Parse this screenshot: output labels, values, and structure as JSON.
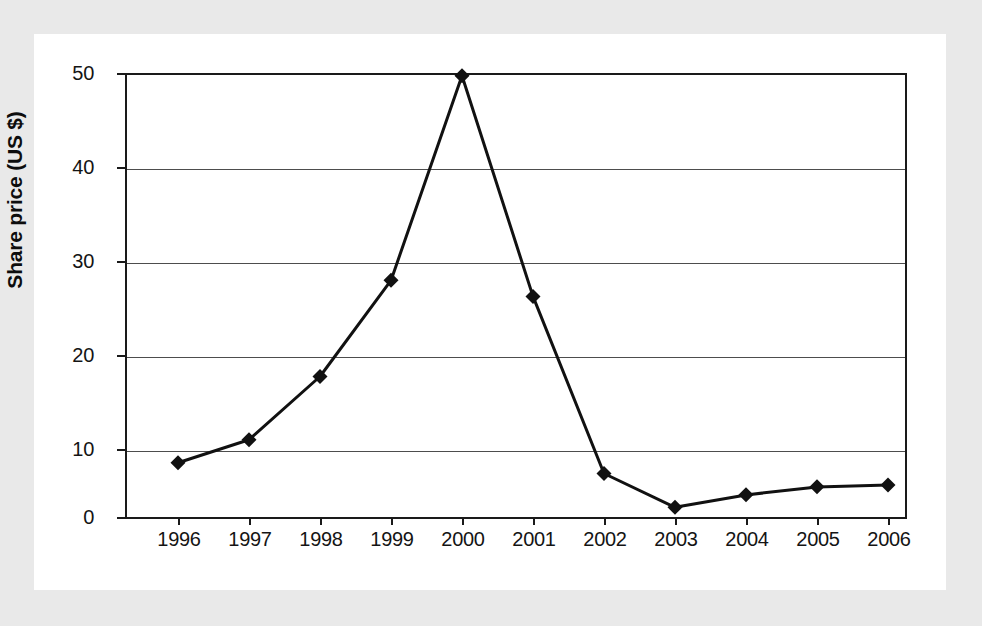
{
  "chart_data": {
    "type": "line",
    "title": "",
    "xlabel": "",
    "ylabel": "Share price (US $)",
    "categories": [
      "1996",
      "1997",
      "1998",
      "1999",
      "2000",
      "2001",
      "2002",
      "2003",
      "2004",
      "2005",
      "2006"
    ],
    "values": [
      6.2,
      8.8,
      15.9,
      26.7,
      49.7,
      24.9,
      5.0,
      1.2,
      2.6,
      3.5,
      3.7
    ],
    "series": [
      {
        "name": "Share price",
        "values": [
          6.2,
          8.8,
          15.9,
          26.7,
          49.7,
          24.9,
          5.0,
          1.2,
          2.6,
          3.5,
          3.7
        ]
      }
    ],
    "ylim": [
      0,
      50
    ],
    "yticks": [
      "0",
      "10",
      "20",
      "30",
      "40",
      "50"
    ],
    "ytick_values": [
      0,
      10,
      20,
      30,
      40,
      50
    ],
    "grid": true,
    "legend": "none",
    "marker": "diamond",
    "line_color": "#111111",
    "marker_color": "#111111",
    "grid_color": "#4d4d4d",
    "background_color": "#ffffff"
  },
  "axes": {
    "y_title": "Share price (US $)",
    "y_labels": [
      "50",
      "40",
      "30",
      "20",
      "10",
      "0"
    ],
    "x_labels": [
      "1996",
      "1997",
      "1998",
      "1999",
      "2000",
      "2001",
      "2002",
      "2003",
      "2004",
      "2005",
      "2006"
    ]
  }
}
